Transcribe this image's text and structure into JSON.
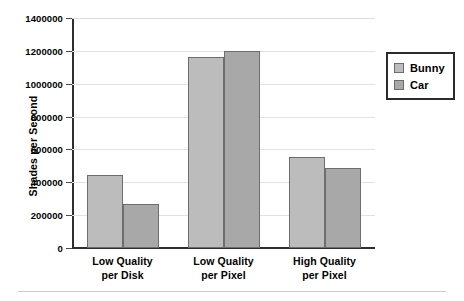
{
  "chart_data": {
    "type": "bar",
    "title": "",
    "xlabel": "",
    "ylabel": "Shades per Second",
    "categories": [
      "Low Quality per Disk",
      "Low Quality per Pixel",
      "High Quality per Pixel"
    ],
    "category_lines": [
      [
        "Low Quality",
        "per Disk"
      ],
      [
        "Low Quality",
        "per Pixel"
      ],
      [
        "High Quality",
        "per Pixel"
      ]
    ],
    "series": [
      {
        "name": "Bunny",
        "values": [
          445000,
          1165000,
          555000
        ],
        "color": "#bcbcbc"
      },
      {
        "name": "Car",
        "values": [
          270000,
          1200000,
          485000
        ],
        "color": "#a8a8a8"
      }
    ],
    "ylim": [
      0,
      1400000
    ],
    "yticks": [
      0,
      200000,
      400000,
      600000,
      800000,
      1000000,
      1200000,
      1400000
    ],
    "ytick_labels": [
      "0",
      "200000",
      "400000",
      "600000",
      "800000",
      "1000000",
      "1200000",
      "1400000"
    ],
    "grid": true,
    "legend_position": "right"
  },
  "legend": {
    "entries": [
      {
        "label": "Bunny"
      },
      {
        "label": "Car"
      }
    ]
  }
}
